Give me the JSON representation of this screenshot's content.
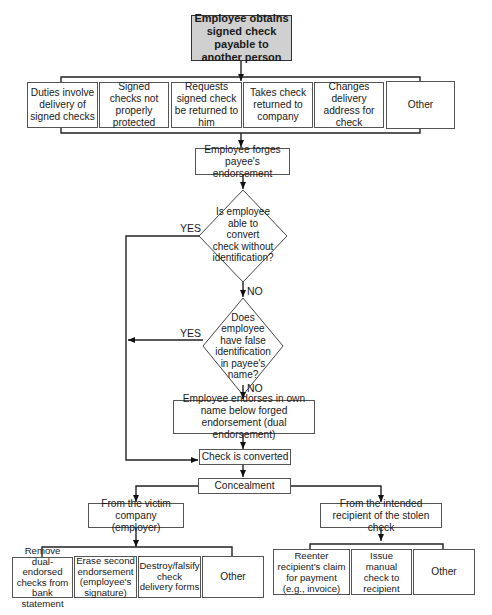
{
  "title_box": "Employee obtains signed check payable to another person",
  "methods": [
    "Duties involve delivery of signed checks",
    "Signed checks not properly protected",
    "Requests signed check be returned to him",
    "Takes check returned to company",
    "Changes delivery address for check",
    "Other"
  ],
  "forge_box": "Employee forges payee's endorsement",
  "decision1": "Is employee able to convert check without identification?",
  "decision2": "Does employee have false identification in payee's name?",
  "dual_box": "Employee endorses in own name below forged endorsement (dual endorsement)",
  "converted_box": "Check is converted",
  "concealment_box": "Concealment",
  "labels": {
    "yes": "YES",
    "no": "NO"
  },
  "victim_branch": {
    "title": "From the victim company (employer)",
    "items": [
      "Remove dual-endorsed checks from bank statement",
      "Erase second endorsement (employee's signature)",
      "Destroy/falsify check delivery forms",
      "Other"
    ]
  },
  "recipient_branch": {
    "title": "From the intended recipient of the stolen check",
    "items": [
      "Reenter recipient's claim for payment (e.g., invoice)",
      "Issue manual check to recipient",
      "Other"
    ]
  }
}
